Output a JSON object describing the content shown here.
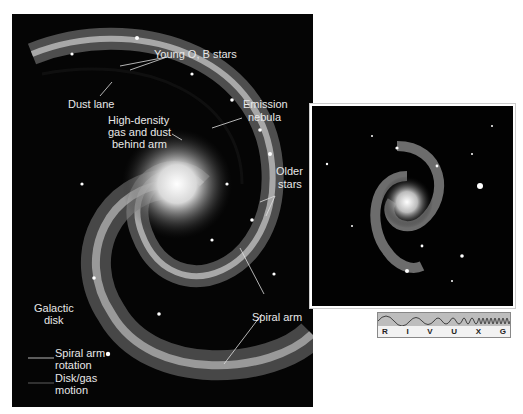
{
  "main_panel": {
    "labels": {
      "young_stars": "Young O, B stars",
      "dust_lane": "Dust lane",
      "high_density_1": "High-density",
      "high_density_2": "gas and dust",
      "high_density_3": "behind arm",
      "emission_1": "Emission",
      "emission_2": "nebula",
      "older_1": "Older",
      "older_2": "stars",
      "galactic_1": "Galactic",
      "galactic_2": "disk",
      "spiral_arm": "Spiral arm",
      "rotation_1": "Spiral arm",
      "rotation_2": "rotation",
      "disk_1": "Disk/gas",
      "disk_2": "motion"
    }
  },
  "inset": {
    "description": "Photograph of spiral galaxy"
  },
  "spectrum_bar": {
    "bands": [
      "R",
      "I",
      "V",
      "U",
      "X",
      "G"
    ]
  }
}
